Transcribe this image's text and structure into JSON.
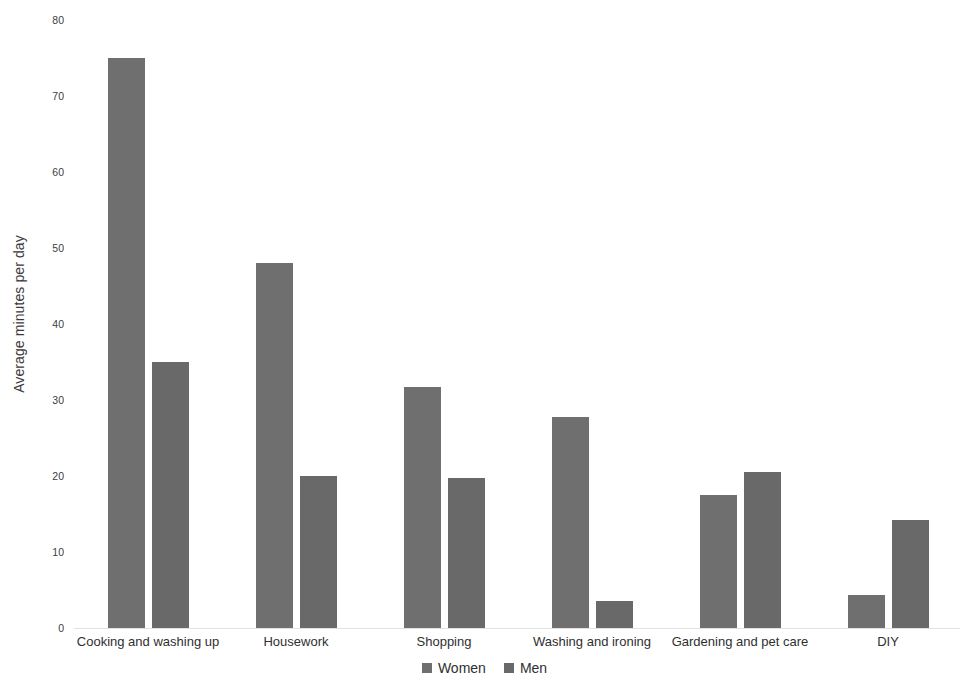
{
  "chart_data": {
    "type": "bar",
    "title": "",
    "xlabel": "",
    "ylabel": "Average minutes per day",
    "ylim": [
      0,
      80
    ],
    "yticks": [
      0,
      10,
      20,
      30,
      40,
      50,
      60,
      70,
      80
    ],
    "ytick_labels": [
      "0",
      "10",
      "20",
      "30",
      "40",
      "50",
      "60",
      "70",
      "80"
    ],
    "grid": false,
    "legend_position": "bottom",
    "categories": [
      "Cooking and washing up",
      "Housework",
      "Shopping",
      "Washing and ironing",
      "Gardening and pet care",
      "DIY"
    ],
    "series": [
      {
        "name": "Women",
        "color": "#6f6f6f",
        "values": [
          75.0,
          48.0,
          31.7,
          27.8,
          17.5,
          4.4
        ]
      },
      {
        "name": "Men",
        "color": "#696969",
        "values": [
          35.0,
          20.0,
          19.7,
          3.6,
          20.5,
          14.2
        ]
      }
    ]
  },
  "legend": {
    "items": [
      {
        "label": "Women",
        "color": "#6f6f6f"
      },
      {
        "label": "Men",
        "color": "#696969"
      }
    ]
  },
  "colors": {
    "background": "#ffffff",
    "bar_women": "#6f6f6f",
    "bar_men": "#696969",
    "text": "#2f2f2f",
    "baseline": "#e3e3e3"
  }
}
